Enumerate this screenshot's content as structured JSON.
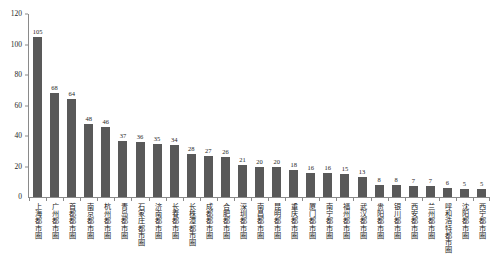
{
  "chart_data": {
    "type": "bar",
    "title": "",
    "subtitle": "",
    "xlabel": "",
    "ylabel": "",
    "ylim": [
      0,
      120
    ],
    "ytick_values": [
      0,
      20,
      40,
      60,
      80,
      100,
      120
    ],
    "ytick_labels": [
      "0",
      "20",
      "40",
      "60",
      "80",
      "100",
      "120"
    ],
    "grid": false,
    "legend": null,
    "bar_color": "#595959",
    "axis_color": "#8a8a8a",
    "categories": [
      "上海都市圈",
      "广州都市圈",
      "首都都市圈",
      "南京都市圈",
      "杭州都市圈",
      "青岛都市圈",
      "石家庄都市圈",
      "济南都市圈",
      "长春都市圈",
      "长株潭都市圈",
      "成都都市圈",
      "合肥都市圈",
      "深圳都市圈",
      "南昌都市圈",
      "昆明都市圈",
      "重庆都市圈",
      "厦门都市圈",
      "南宁都市圈",
      "福州都市圈",
      "武汉都市圈",
      "贵阳都市圈",
      "银川都市圈",
      "西安都市圈",
      "兰州都市圈",
      "呼和浩特都市圈",
      "沈阳都市圈",
      "西宁都市圈"
    ],
    "values": [
      105,
      68,
      64,
      48,
      46,
      37,
      36,
      35,
      34,
      28,
      27,
      26,
      21,
      20,
      20,
      18,
      16,
      16,
      15,
      13,
      8,
      8,
      7,
      7,
      6,
      5,
      5
    ],
    "value_labels": [
      "105",
      "68",
      "64",
      "48",
      "46",
      "37",
      "36",
      "35",
      "34",
      "28",
      "27",
      "26",
      "21",
      "20",
      "20",
      "18",
      "16",
      "16",
      "15",
      "13",
      "8",
      "8",
      "7",
      "7",
      "6",
      "5",
      "5"
    ]
  }
}
